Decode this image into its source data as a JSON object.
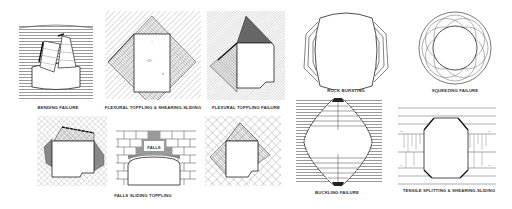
{
  "figure": {
    "colors": {
      "background": "#ffffff",
      "line": "#222222",
      "hatch": "#888888",
      "shade": "#7a7a7a",
      "label": "#333333"
    }
  },
  "panels": [
    {
      "id": "bending",
      "label": "BENDING FAILURE",
      "row": 1
    },
    {
      "id": "flexural-toppling-shearing",
      "label": "FLEXURAL TOPPLING & SHEARING-SLIDING",
      "row": 1
    },
    {
      "id": "flexural-toppling",
      "label": "FLEXURAL TOPPLING FAILURE",
      "row": 1
    },
    {
      "id": "rock-bursting",
      "label": "ROCK BURSTING",
      "row": 1
    },
    {
      "id": "squeezing",
      "label": "SQUEEZING FAILURE",
      "row": 1
    },
    {
      "id": "falls-sliding-toppling",
      "label": "FALLS  SLIDING  TOPPLING",
      "row": 2,
      "inner_label": "FALLS"
    },
    {
      "id": "buckling",
      "label": "BUCKLING FAILURE",
      "row": 2
    },
    {
      "id": "tensile-splitting",
      "label": "TENSILE SPLITTING & SHEARING-SLIDING",
      "row": 2
    }
  ]
}
